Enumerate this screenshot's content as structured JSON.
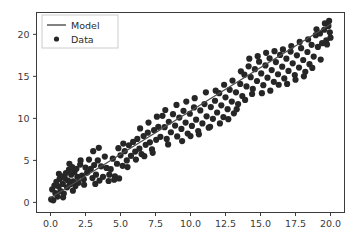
{
  "chart_data": {
    "type": "scatter",
    "title": "",
    "xlabel": "",
    "ylabel": "",
    "xlim": [
      -1.0,
      21.0
    ],
    "ylim": [
      -1.2,
      22.6
    ],
    "grid": false,
    "legend_position": "upper left",
    "xticks": [
      0.0,
      2.5,
      5.0,
      7.5,
      10.0,
      12.5,
      15.0,
      17.5,
      20.0
    ],
    "xtick_labels": [
      "0.0",
      "2.5",
      "5.0",
      "7.5",
      "10.0",
      "12.5",
      "15.0",
      "17.5",
      "20.0"
    ],
    "yticks": [
      0,
      5,
      10,
      15,
      20
    ],
    "ytick_labels": [
      "0",
      "5",
      "10",
      "15",
      "20"
    ],
    "series": [
      {
        "name": "Model",
        "type": "line",
        "color": "#4d4d4d",
        "linewidth": 1.3,
        "x": [
          0.0,
          20.0
        ],
        "y": [
          0.55,
          21.2
        ]
      },
      {
        "name": "Data",
        "type": "scatter",
        "color": "#262626",
        "marker": "o",
        "markersize": 3.1,
        "points": [
          [
            0.05,
            0.35
          ],
          [
            0.12,
            1.55
          ],
          [
            0.2,
            0.25
          ],
          [
            0.28,
            2.0
          ],
          [
            0.35,
            1.1
          ],
          [
            0.42,
            2.45
          ],
          [
            0.5,
            0.7
          ],
          [
            0.58,
            1.9
          ],
          [
            0.65,
            2.8
          ],
          [
            0.72,
            1.35
          ],
          [
            0.8,
            3.1
          ],
          [
            0.88,
            2.2
          ],
          [
            0.95,
            1.05
          ],
          [
            1.02,
            2.9
          ],
          [
            1.1,
            3.5
          ],
          [
            1.18,
            1.8
          ],
          [
            1.25,
            2.6
          ],
          [
            1.32,
            3.9
          ],
          [
            1.4,
            2.15
          ],
          [
            1.48,
            3.3
          ],
          [
            1.55,
            4.2
          ],
          [
            1.62,
            2.5
          ],
          [
            1.7,
            3.6
          ],
          [
            1.78,
            1.95
          ],
          [
            1.85,
            4.0
          ],
          [
            1.92,
            3.05
          ],
          [
            2.0,
            2.35
          ],
          [
            2.12,
            4.5
          ],
          [
            2.25,
            3.2
          ],
          [
            2.38,
            2.75
          ],
          [
            2.5,
            4.15
          ],
          [
            2.62,
            3.55
          ],
          [
            2.75,
            5.1
          ],
          [
            2.88,
            4.0
          ],
          [
            3.0,
            2.9
          ],
          [
            3.12,
            4.45
          ],
          [
            3.25,
            3.3
          ],
          [
            3.38,
            5.0
          ],
          [
            3.5,
            2.6
          ],
          [
            3.62,
            4.3
          ],
          [
            3.75,
            3.05
          ],
          [
            3.88,
            5.45
          ],
          [
            4.0,
            4.1
          ],
          [
            4.15,
            2.55
          ],
          [
            4.3,
            3.95
          ],
          [
            4.45,
            5.2
          ],
          [
            4.6,
            3.1
          ],
          [
            4.75,
            4.6
          ],
          [
            4.9,
            2.85
          ],
          [
            5.0,
            5.6
          ],
          [
            5.15,
            4.35
          ],
          [
            5.3,
            6.1
          ],
          [
            5.45,
            5.0
          ],
          [
            5.6,
            6.8
          ],
          [
            5.75,
            5.55
          ],
          [
            5.9,
            7.2
          ],
          [
            6.05,
            6.05
          ],
          [
            6.2,
            7.55
          ],
          [
            6.35,
            6.4
          ],
          [
            6.5,
            5.75
          ],
          [
            6.65,
            7.9
          ],
          [
            6.8,
            6.85
          ],
          [
            6.95,
            8.3
          ],
          [
            7.1,
            7.15
          ],
          [
            7.25,
            6.3
          ],
          [
            7.4,
            8.6
          ],
          [
            7.55,
            7.45
          ],
          [
            7.7,
            9.0
          ],
          [
            7.85,
            7.8
          ],
          [
            8.0,
            10.3
          ],
          [
            8.15,
            8.95
          ],
          [
            8.3,
            7.55
          ],
          [
            8.45,
            9.6
          ],
          [
            8.6,
            8.35
          ],
          [
            8.75,
            10.5
          ],
          [
            8.9,
            9.15
          ],
          [
            9.05,
            7.85
          ],
          [
            9.2,
            10.1
          ],
          [
            9.35,
            8.75
          ],
          [
            9.5,
            10.9
          ],
          [
            9.65,
            9.5
          ],
          [
            9.8,
            8.2
          ],
          [
            9.95,
            10.55
          ],
          [
            10.1,
            9.1
          ],
          [
            10.25,
            11.3
          ],
          [
            10.4,
            9.85
          ],
          [
            10.55,
            8.5
          ],
          [
            10.7,
            10.95
          ],
          [
            10.85,
            9.4
          ],
          [
            11.0,
            11.7
          ],
          [
            11.15,
            10.25
          ],
          [
            11.3,
            8.9
          ],
          [
            11.45,
            11.35
          ],
          [
            11.6,
            9.95
          ],
          [
            11.75,
            12.1
          ],
          [
            11.9,
            10.7
          ],
          [
            12.05,
            13.0
          ],
          [
            12.2,
            11.55
          ],
          [
            12.35,
            10.15
          ],
          [
            12.5,
            12.5
          ],
          [
            12.65,
            11.1
          ],
          [
            12.8,
            13.4
          ],
          [
            12.95,
            12.0
          ],
          [
            13.1,
            10.6
          ],
          [
            13.25,
            13.1
          ],
          [
            13.4,
            11.7
          ],
          [
            13.55,
            14.1
          ],
          [
            13.7,
            12.65
          ],
          [
            13.85,
            15.2
          ],
          [
            14.0,
            13.8
          ],
          [
            14.15,
            16.2
          ],
          [
            14.3,
            14.9
          ],
          [
            14.45,
            13.5
          ],
          [
            14.6,
            15.85
          ],
          [
            14.75,
            14.45
          ],
          [
            14.9,
            16.75
          ],
          [
            15.05,
            15.35
          ],
          [
            15.2,
            13.95
          ],
          [
            15.35,
            16.3
          ],
          [
            15.5,
            14.85
          ],
          [
            15.65,
            17.15
          ],
          [
            15.8,
            15.75
          ],
          [
            15.95,
            14.35
          ],
          [
            16.1,
            16.7
          ],
          [
            16.25,
            15.25
          ],
          [
            16.4,
            17.55
          ],
          [
            16.55,
            16.15
          ],
          [
            16.7,
            14.75
          ],
          [
            16.85,
            17.1
          ],
          [
            17.0,
            15.65
          ],
          [
            17.15,
            17.95
          ],
          [
            17.3,
            16.55
          ],
          [
            17.45,
            15.15
          ],
          [
            17.6,
            17.5
          ],
          [
            17.75,
            16.05
          ],
          [
            17.9,
            18.35
          ],
          [
            18.05,
            16.95
          ],
          [
            18.2,
            15.55
          ],
          [
            18.35,
            17.9
          ],
          [
            18.5,
            16.45
          ],
          [
            18.65,
            18.75
          ],
          [
            18.8,
            17.35
          ],
          [
            18.95,
            19.9
          ],
          [
            19.1,
            18.5
          ],
          [
            19.25,
            20.1
          ],
          [
            19.4,
            18.95
          ],
          [
            19.55,
            20.55
          ],
          [
            19.7,
            19.3
          ],
          [
            19.85,
            21.0
          ],
          [
            19.95,
            20.25
          ],
          [
            3.05,
            6.1
          ],
          [
            3.45,
            6.5
          ],
          [
            2.15,
            5.0
          ],
          [
            1.35,
            4.6
          ],
          [
            0.6,
            3.4
          ],
          [
            4.85,
            6.45
          ],
          [
            5.2,
            7.0
          ],
          [
            6.4,
            8.8
          ],
          [
            7.0,
            9.5
          ],
          [
            7.6,
            10.2
          ],
          [
            8.2,
            11.0
          ],
          [
            9.0,
            11.6
          ],
          [
            9.7,
            12.0
          ],
          [
            10.3,
            12.4
          ],
          [
            11.1,
            13.1
          ],
          [
            11.8,
            13.3
          ],
          [
            12.4,
            14.0
          ],
          [
            13.0,
            14.5
          ],
          [
            13.6,
            15.6
          ],
          [
            14.2,
            17.1
          ],
          [
            14.8,
            17.4
          ],
          [
            15.4,
            17.8
          ],
          [
            16.0,
            18.0
          ],
          [
            16.6,
            18.2
          ],
          [
            17.2,
            18.6
          ],
          [
            17.8,
            19.1
          ],
          [
            18.4,
            19.4
          ],
          [
            19.0,
            20.6
          ],
          [
            19.6,
            21.3
          ],
          [
            19.9,
            21.6
          ],
          [
            0.9,
            0.6
          ],
          [
            1.6,
            1.4
          ],
          [
            2.4,
            2.1
          ],
          [
            3.2,
            2.2
          ],
          [
            4.2,
            3.3
          ],
          [
            4.55,
            2.7
          ],
          [
            5.5,
            4.2
          ],
          [
            6.1,
            5.1
          ],
          [
            6.7,
            5.5
          ],
          [
            7.3,
            5.9
          ],
          [
            8.4,
            6.9
          ],
          [
            9.4,
            7.3
          ],
          [
            10.0,
            7.9
          ],
          [
            10.6,
            8.1
          ],
          [
            11.4,
            9.0
          ],
          [
            12.1,
            9.4
          ],
          [
            12.7,
            9.9
          ],
          [
            13.3,
            11.1
          ],
          [
            13.9,
            12.2
          ],
          [
            14.4,
            12.9
          ],
          [
            15.1,
            13.0
          ],
          [
            15.7,
            13.3
          ],
          [
            16.3,
            14.0
          ],
          [
            16.9,
            14.1
          ],
          [
            17.5,
            14.6
          ],
          [
            18.1,
            15.0
          ],
          [
            18.7,
            16.0
          ],
          [
            19.3,
            17.0
          ],
          [
            19.75,
            18.8
          ],
          [
            20.0,
            19.6
          ]
        ]
      }
    ]
  },
  "legend": {
    "entries": [
      {
        "label": "Model",
        "marker": "line"
      },
      {
        "label": "Data",
        "marker": "dot"
      }
    ]
  },
  "colors": {
    "axis": "#3b3b3b",
    "line": "#4d4d4d",
    "marker": "#262626",
    "background": "#ffffff",
    "legend_border": "#cccccc"
  }
}
